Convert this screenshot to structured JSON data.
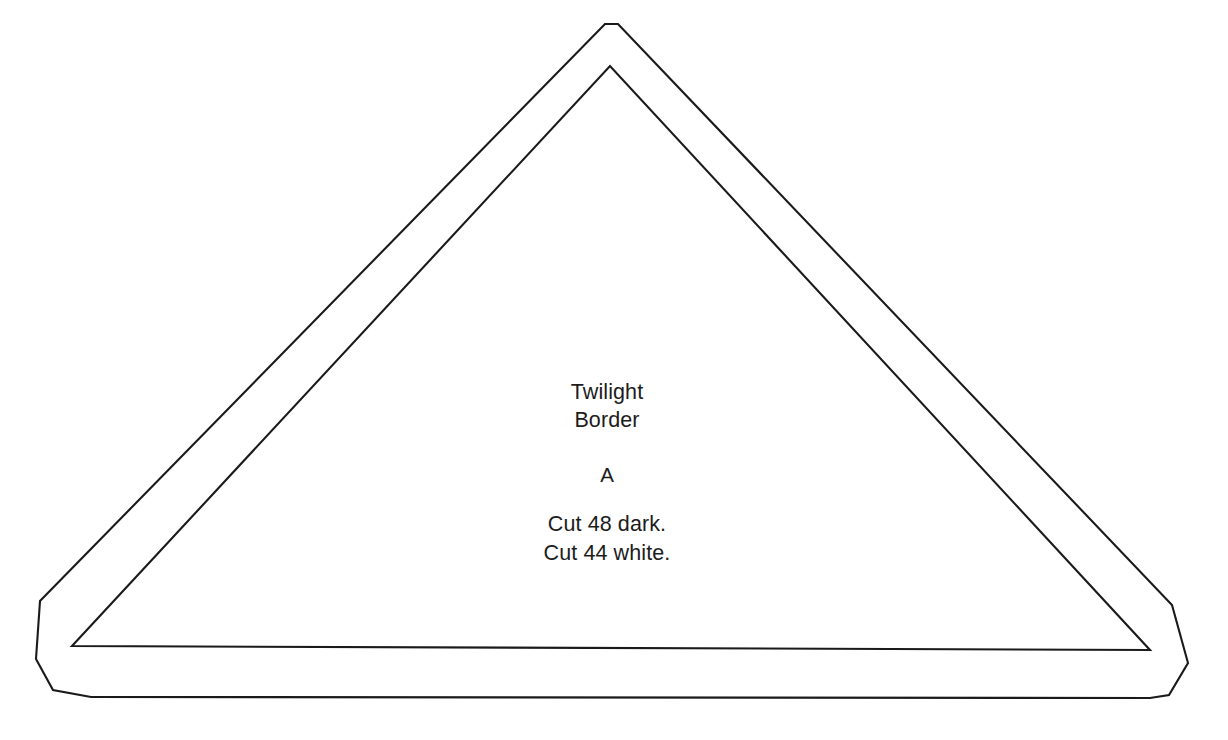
{
  "document": {
    "kind": "quilt-pattern-template",
    "background_color": "#ffffff",
    "line_color": "#1a1a1a"
  },
  "piece": {
    "pattern_name_line1": "Twilight",
    "pattern_name_line2": "Border",
    "piece_letter": "A",
    "cut_instruction_line1": "Cut 48 dark.",
    "cut_instruction_line2": "Cut 44 white.",
    "outer_outline_name": "cutting-line",
    "inner_outline_name": "sewing-line"
  },
  "geometry": {
    "outer_points": "40,601 36,659 53,690 91,697 1150,698 1169,695 1188,663 1172,605 618,24 605,24",
    "inner_points": "72,646 610,66 1150,650"
  }
}
